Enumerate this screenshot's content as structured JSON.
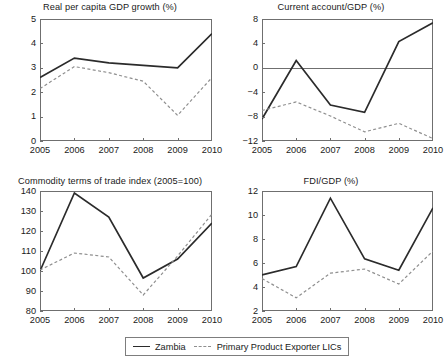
{
  "figure": {
    "width": 441,
    "height": 363,
    "background": "#ffffff"
  },
  "legend": {
    "position": "bottom-center",
    "entries": [
      {
        "label": "Zambia",
        "style": "solid",
        "color": "#2b2b2b"
      },
      {
        "label": "Primary Product Exporter LICs",
        "style": "dashed",
        "color": "#8f8f8f"
      }
    ]
  },
  "chart_data": [
    {
      "type": "line",
      "title": "Real per capita GDP growth (%)",
      "xlabel": "",
      "ylabel": "",
      "x": [
        "2005",
        "2006",
        "2007",
        "2008",
        "2009",
        "2010"
      ],
      "xticklabels": [
        "2005",
        "2006",
        "2007",
        "2008",
        "2009",
        "2010"
      ],
      "yticks": [
        0,
        1,
        2,
        3,
        4,
        5
      ],
      "yticklabels": [
        "0",
        "1",
        "2",
        "3",
        "4",
        "5"
      ],
      "ylim": [
        0,
        5
      ],
      "grid": false,
      "zero_line": false,
      "series": [
        {
          "name": "Zambia",
          "style": "solid",
          "values": [
            2.6,
            3.4,
            3.2,
            3.1,
            3.0,
            4.4
          ]
        },
        {
          "name": "Primary Product Exporter LICs",
          "style": "dashed",
          "values": [
            2.15,
            3.05,
            2.8,
            2.45,
            1.05,
            2.6
          ]
        }
      ]
    },
    {
      "type": "line",
      "title": "Current account/GDP (%)",
      "xlabel": "",
      "ylabel": "",
      "x": [
        "2005",
        "2006",
        "2007",
        "2008",
        "2009",
        "2010"
      ],
      "xticklabels": [
        "2005",
        "2006",
        "2007",
        "2008",
        "2009",
        "2010"
      ],
      "yticks": [
        -12,
        -8,
        -4,
        0,
        4,
        8
      ],
      "yticklabels": [
        "−12",
        "−8",
        "−4",
        "0",
        "4",
        "8"
      ],
      "ylim": [
        -12,
        8
      ],
      "grid": false,
      "zero_line": true,
      "series": [
        {
          "name": "Zambia",
          "style": "solid",
          "values": [
            -8.4,
            1.2,
            -6.1,
            -7.3,
            4.3,
            7.4
          ]
        },
        {
          "name": "Primary Product Exporter LICs",
          "style": "dashed",
          "values": [
            -7.0,
            -5.6,
            -7.9,
            -10.5,
            -9.1,
            -11.6
          ]
        }
      ]
    },
    {
      "type": "line",
      "title": "Commodity terms of trade index (2005=100)",
      "xlabel": "",
      "ylabel": "",
      "x": [
        "2005",
        "2006",
        "2007",
        "2008",
        "2009",
        "2010"
      ],
      "xticklabels": [
        "2005",
        "2006",
        "2007",
        "2008",
        "2009",
        "2010"
      ],
      "yticks": [
        80,
        90,
        100,
        110,
        120,
        130,
        140
      ],
      "yticklabels": [
        "80",
        "90",
        "100",
        "110",
        "120",
        "130",
        "140"
      ],
      "ylim": [
        80,
        140
      ],
      "grid": false,
      "zero_line": false,
      "series": [
        {
          "name": "Zambia",
          "style": "solid",
          "values": [
            100,
            139,
            127,
            96.5,
            106,
            124
          ]
        },
        {
          "name": "Primary Product Exporter LICs",
          "style": "dashed",
          "values": [
            100.5,
            109,
            107,
            88,
            107.5,
            128.5
          ]
        }
      ]
    },
    {
      "type": "line",
      "title": "FDI/GDP (%)",
      "xlabel": "",
      "ylabel": "",
      "x": [
        "2005",
        "2006",
        "2007",
        "2008",
        "2009",
        "2010"
      ],
      "xticklabels": [
        "2005",
        "2006",
        "2007",
        "2008",
        "2009",
        "2010"
      ],
      "yticks": [
        2,
        4,
        6,
        8,
        10,
        12
      ],
      "yticklabels": [
        "2",
        "4",
        "6",
        "8",
        "10",
        "12"
      ],
      "ylim": [
        2,
        12
      ],
      "grid": false,
      "zero_line": false,
      "series": [
        {
          "name": "Zambia",
          "style": "solid",
          "values": [
            5.0,
            5.7,
            11.4,
            6.35,
            5.4,
            10.6
          ]
        },
        {
          "name": "Primary Product Exporter LICs",
          "style": "dashed",
          "values": [
            4.7,
            3.1,
            5.15,
            5.5,
            4.25,
            7.0
          ]
        }
      ]
    }
  ]
}
